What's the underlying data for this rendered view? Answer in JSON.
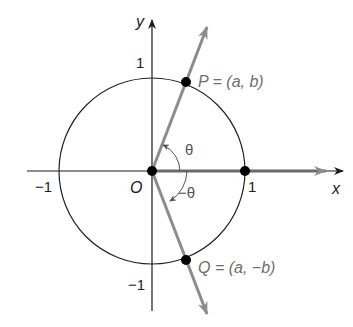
{
  "figure": {
    "axes": {
      "x_label": "x",
      "y_label": "y",
      "x_tick_neg": "−1",
      "x_tick_pos": "1",
      "y_tick_pos": "1",
      "y_tick_neg": "−1",
      "origin_label": "O"
    },
    "points": {
      "P_label": "P = (a, b)",
      "Q_label": "Q = (a, −b)"
    },
    "angles": {
      "theta": "θ",
      "neg_theta": "−θ"
    },
    "colors": {
      "axis": "#1a1a1a",
      "ray": "#8c8c8c",
      "label_gray": "#6e6e6e",
      "point": "#000000"
    }
  }
}
